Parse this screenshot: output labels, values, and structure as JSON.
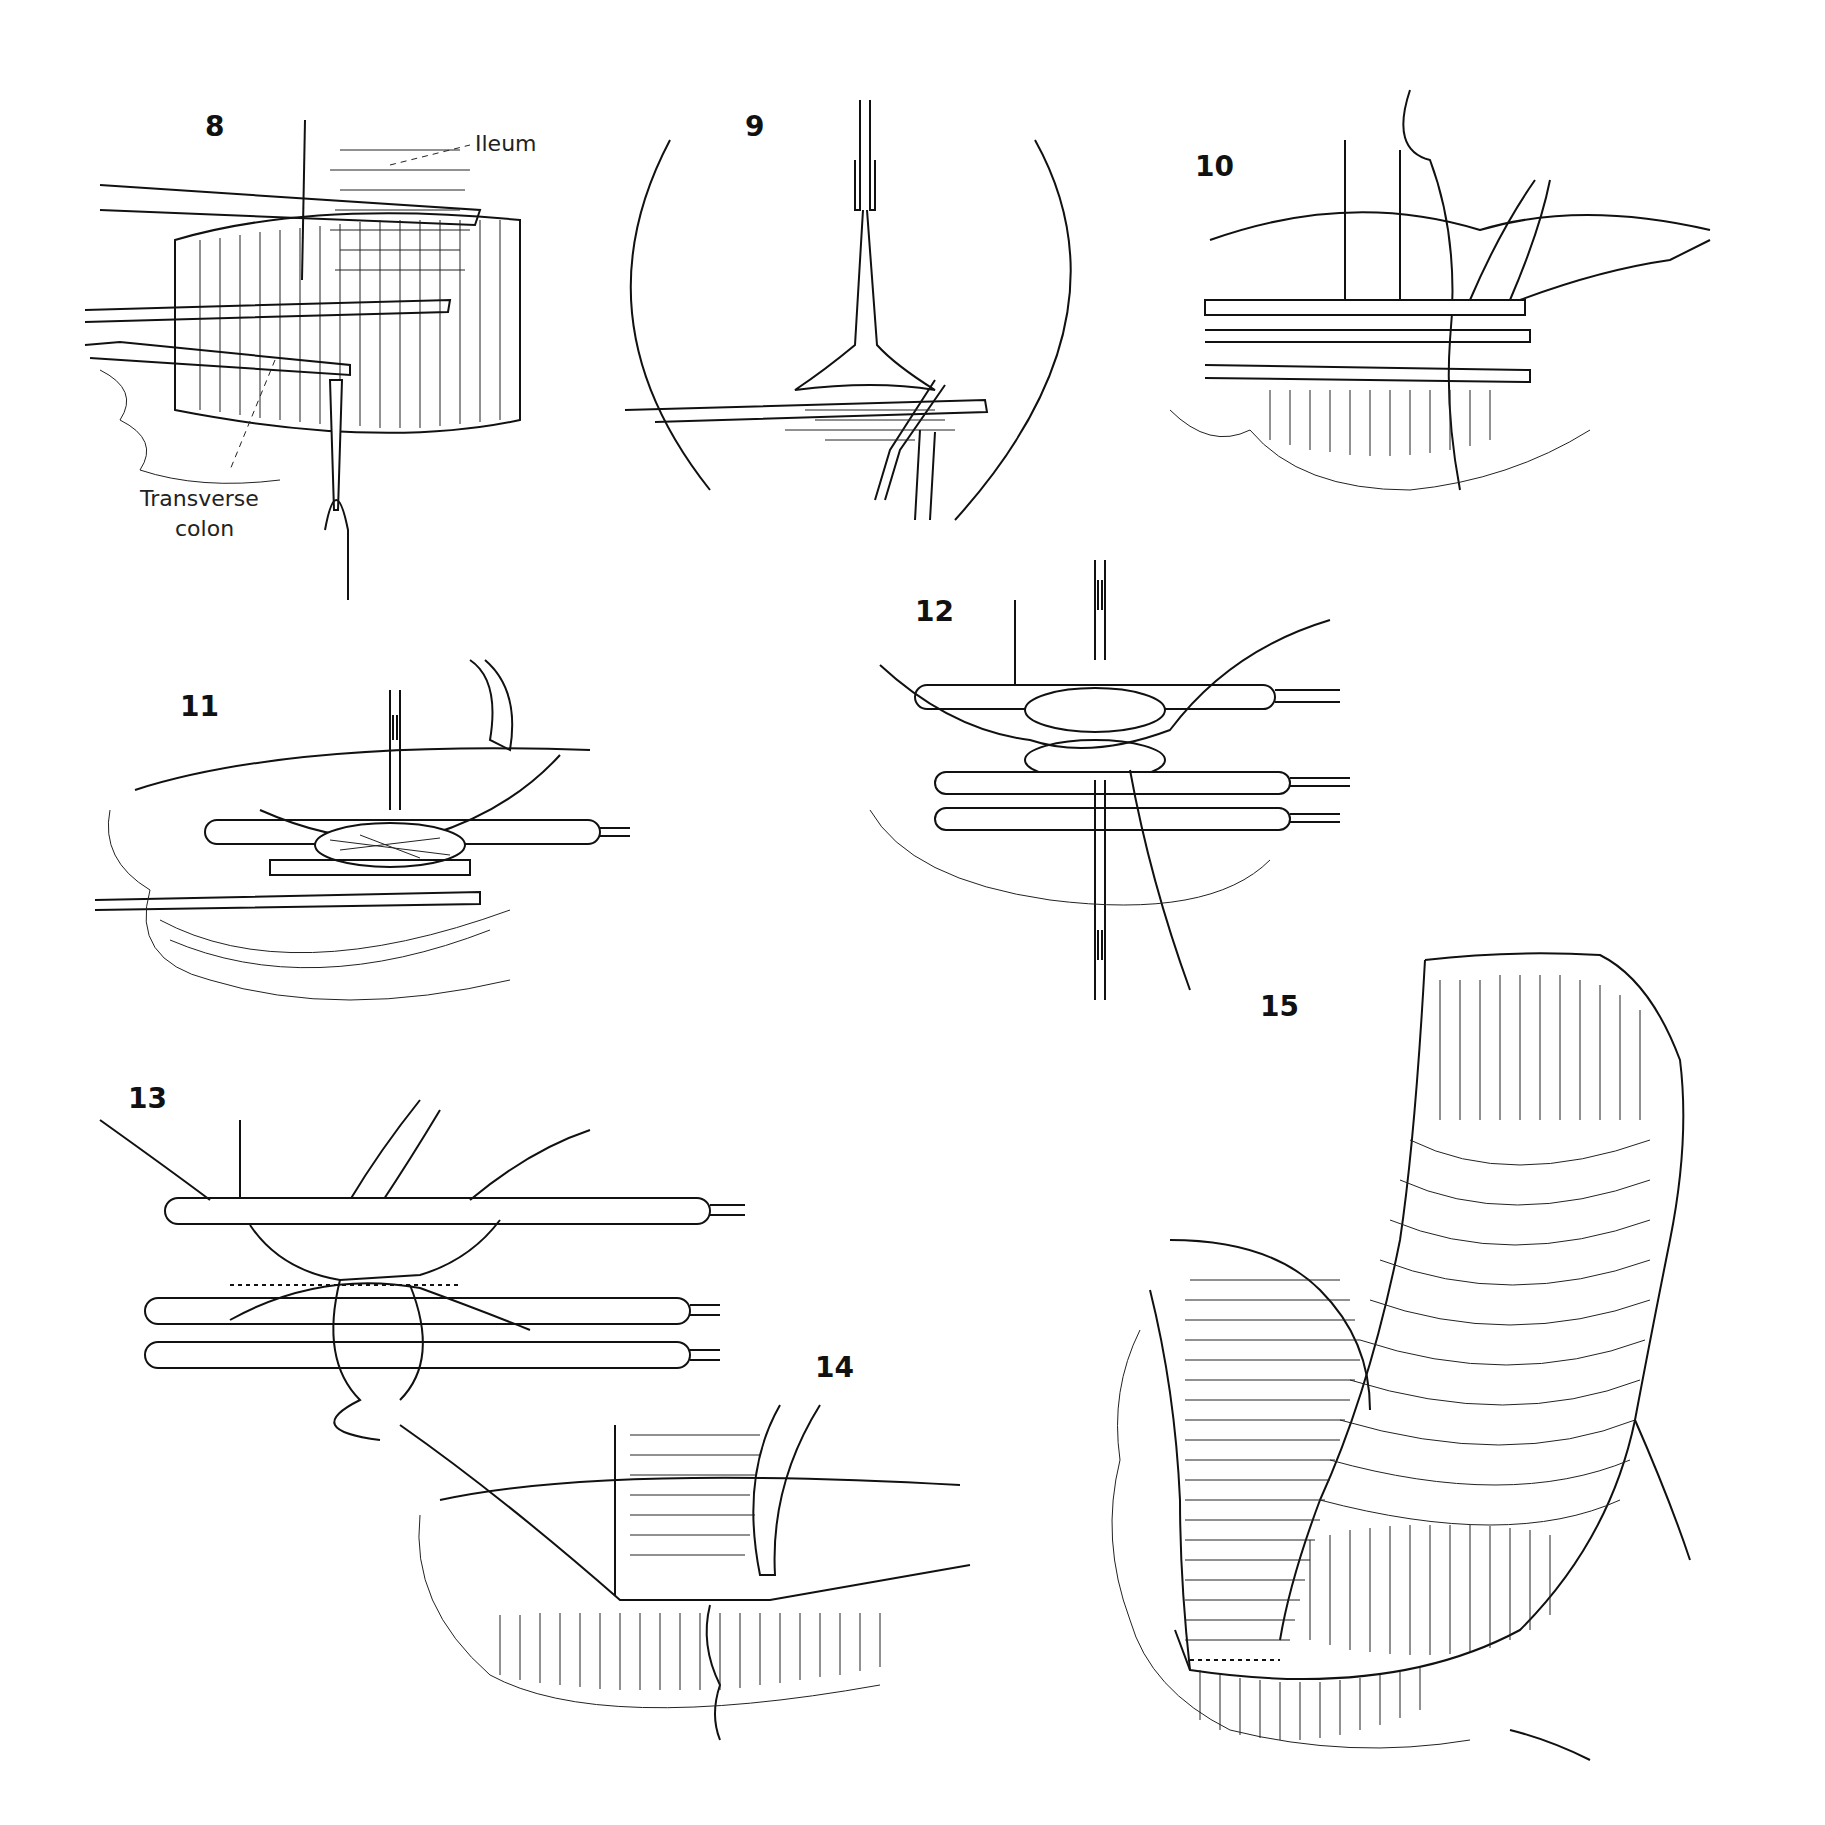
{
  "figure": {
    "panels": [
      {
        "id": "8",
        "number": "8",
        "labels": [
          "Ileum",
          "Transverse colon"
        ]
      },
      {
        "id": "9",
        "number": "9"
      },
      {
        "id": "10",
        "number": "10"
      },
      {
        "id": "11",
        "number": "11"
      },
      {
        "id": "12",
        "number": "12"
      },
      {
        "id": "13",
        "number": "13"
      },
      {
        "id": "14",
        "number": "14"
      },
      {
        "id": "15",
        "number": "15"
      }
    ],
    "labels": {
      "ileum": "Ileum",
      "transverse_1": "Transverse",
      "transverse_2": "colon"
    }
  }
}
